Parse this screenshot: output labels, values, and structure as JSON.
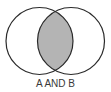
{
  "diagram": {
    "type": "venn",
    "label": "A AND B",
    "sets": [
      "A",
      "B"
    ],
    "highlighted_region": "intersection",
    "colors": {
      "stroke": "#2a2a2a",
      "intersection_fill": "#b4b4b4",
      "background": "#ffffff",
      "label": "#3a3a3a"
    }
  }
}
